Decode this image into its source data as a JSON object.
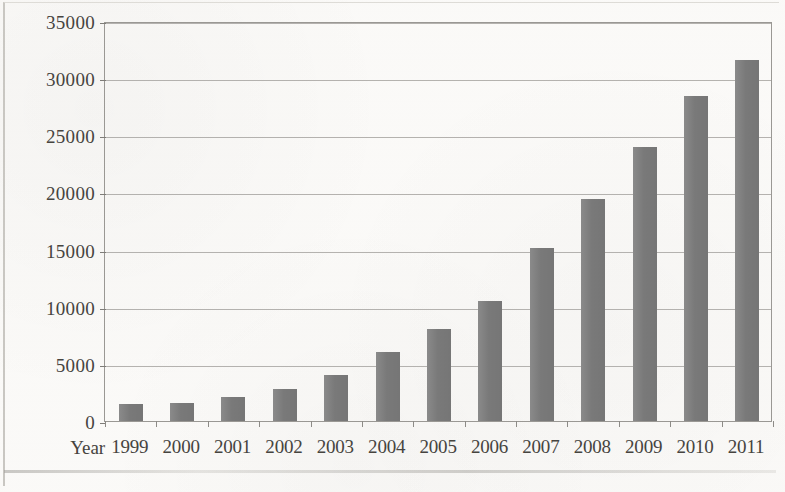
{
  "chart_data": {
    "type": "bar",
    "title": "",
    "xlabel": "Year",
    "ylabel": "",
    "categories": [
      "1999",
      "2000",
      "2001",
      "2002",
      "2003",
      "2004",
      "2005",
      "2006",
      "2007",
      "2008",
      "2009",
      "2010",
      "2011"
    ],
    "values": [
      1450,
      1600,
      2100,
      2800,
      4000,
      6000,
      8050,
      10500,
      15150,
      19400,
      23950,
      28400,
      31600
    ],
    "ylim": [
      0,
      35000
    ],
    "ytick_values": [
      0,
      5000,
      10000,
      15000,
      20000,
      25000,
      30000,
      35000
    ],
    "ytick_labels": [
      "0",
      "5000",
      "10000",
      "15000",
      "20000",
      "25000",
      "30000",
      "35000"
    ],
    "grid": true,
    "legend": false,
    "bar_color": "#7d7d7d",
    "gridline_color": "#a8a6a2",
    "axis_color": "#9a9894",
    "background_color": "#fbfaf8",
    "text_color": "#46443f"
  },
  "axis": {
    "x_title": "Year"
  }
}
